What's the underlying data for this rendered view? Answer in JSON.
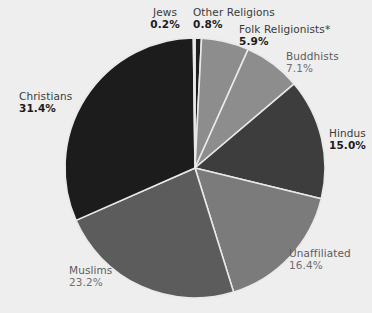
{
  "chart_data": {
    "type": "pie",
    "title": "",
    "subtitle": "",
    "xlabel": "",
    "ylabel": "",
    "legend_position": "none",
    "grid": false,
    "start_angle_deg": 0,
    "direction": "clockwise",
    "categories": [
      "Other Religions",
      "Folk Religionists*",
      "Buddhists",
      "Hindus",
      "Unaffiliated",
      "Muslims",
      "Christians",
      "Jews"
    ],
    "values": [
      0.8,
      5.9,
      7.1,
      15.0,
      16.4,
      23.2,
      31.4,
      0.2
    ],
    "units": "percent",
    "slices": [
      {
        "label": "Other Religions",
        "value": 0.8,
        "percent_text": "0.8%",
        "color": "#1c1c1c",
        "emphasis": "bold"
      },
      {
        "label": "Folk Religionists*",
        "value": 5.9,
        "percent_text": "5.9%",
        "color": "#8d8d8d",
        "emphasis": "bold"
      },
      {
        "label": "Buddhists",
        "value": 7.1,
        "percent_text": "7.1%",
        "color": "#8d8d8d",
        "emphasis": "light"
      },
      {
        "label": "Hindus",
        "value": 15.0,
        "percent_text": "15.0%",
        "color": "#3d3d3d",
        "emphasis": "bold"
      },
      {
        "label": "Unaffiliated",
        "value": 16.4,
        "percent_text": "16.4%",
        "color": "#7b7b7b",
        "emphasis": "light"
      },
      {
        "label": "Muslims",
        "value": 23.2,
        "percent_text": "23.2%",
        "color": "#5c5c5c",
        "emphasis": "light"
      },
      {
        "label": "Christians",
        "value": 31.4,
        "percent_text": "31.4%",
        "color": "#1c1c1c",
        "emphasis": "bold"
      },
      {
        "label": "Jews",
        "value": 0.2,
        "percent_text": "0.2%",
        "color": "#1c1c1c",
        "emphasis": "bold"
      }
    ]
  },
  "labels": {
    "jews": {
      "name": "Jews",
      "pct": "0.2%"
    },
    "other": {
      "name": "Other Religions",
      "pct": "0.8%"
    },
    "folk": {
      "name": "Folk Religionists*",
      "pct": "5.9%"
    },
    "buddhists": {
      "name": "Buddhists",
      "pct": "7.1%"
    },
    "hindus": {
      "name": "Hindus",
      "pct": "15.0%"
    },
    "unaffiliated": {
      "name": "Unaffiliated",
      "pct": "16.4%"
    },
    "muslims": {
      "name": "Muslims",
      "pct": "23.2%"
    },
    "christians": {
      "name": "Christians",
      "pct": "31.4%"
    }
  },
  "style": {
    "background": "#eeeeee",
    "slice_border": "#e9e9e9",
    "center_x": 195,
    "center_y": 168,
    "radius": 130
  }
}
